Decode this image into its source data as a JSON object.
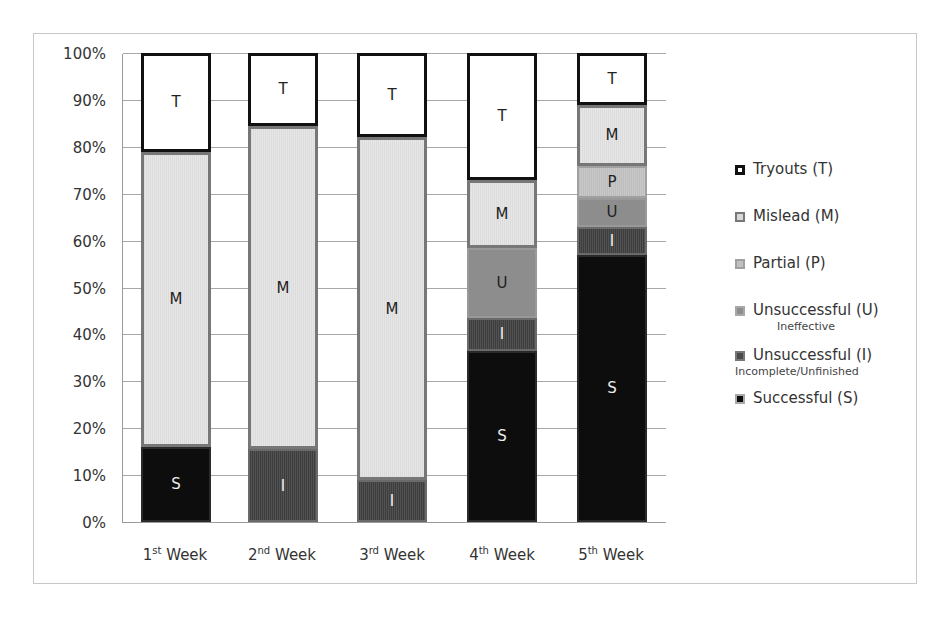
{
  "chart_data": {
    "type": "bar",
    "stacked": true,
    "percent": true,
    "title": "",
    "xlabel": "",
    "ylabel": "",
    "ylim": [
      0,
      100
    ],
    "yticks": [
      "0%",
      "10%",
      "20%",
      "30%",
      "40%",
      "50%",
      "60%",
      "70%",
      "80%",
      "90%",
      "100%"
    ],
    "categories": [
      "1st Week",
      "2nd Week",
      "3rd Week",
      "4th Week",
      "5th Week"
    ],
    "series": [
      {
        "name": "Successful (S)",
        "code": "S",
        "values": [
          16,
          0,
          0,
          36.5,
          57
        ]
      },
      {
        "name": "Unsuccessful (I)",
        "code": "I",
        "subtitle": "Incomplete/Unfinished",
        "values": [
          0,
          15.5,
          9,
          7,
          6
        ]
      },
      {
        "name": "Unsuccessful (U)",
        "code": "U",
        "subtitle": "Ineffective",
        "values": [
          0,
          0,
          0,
          15,
          6
        ]
      },
      {
        "name": "Partial (P)",
        "code": "P",
        "values": [
          0,
          0,
          0,
          0,
          7
        ]
      },
      {
        "name": "Mislead (M)",
        "code": "M",
        "values": [
          63,
          69,
          73,
          14.5,
          13
        ]
      },
      {
        "name": "Tryouts (T)",
        "code": "T",
        "values": [
          21,
          15.5,
          18,
          27,
          11
        ]
      }
    ],
    "grid": true,
    "legend_position": "right"
  },
  "xlabels": [
    {
      "num": "1",
      "sup": "st",
      "word": "Week"
    },
    {
      "num": "2",
      "sup": "nd",
      "word": "Week"
    },
    {
      "num": "3",
      "sup": "rd",
      "word": "Week"
    },
    {
      "num": "4",
      "sup": "th",
      "word": "Week"
    },
    {
      "num": "5",
      "sup": "th",
      "word": "Week"
    }
  ],
  "legend": [
    {
      "code": "T",
      "label": "Tryouts (T)",
      "sub": "",
      "swatch": "#ffffff",
      "border": "#111111"
    },
    {
      "code": "M",
      "label": "Mislead (M)",
      "sub": "",
      "swatch": "#d8d8d8",
      "border": "#777777"
    },
    {
      "code": "P",
      "label": "Partial (P)",
      "sub": "",
      "swatch": "#c0c0c0",
      "border": "#a0a0a0"
    },
    {
      "code": "U",
      "label": "Unsuccessful (U)",
      "sub": "Ineffective",
      "swatch": "#8d8d8d",
      "border": "#a8a8a8"
    },
    {
      "code": "I",
      "label": "Unsuccessful (I)",
      "sub": "Incomplete/Unfinished",
      "swatch": "#4a4a4a",
      "border": "#777777"
    },
    {
      "code": "S",
      "label": "Successful (S)",
      "sub": "",
      "swatch": "#0d0d0d",
      "border": "#aaaaaa"
    }
  ]
}
